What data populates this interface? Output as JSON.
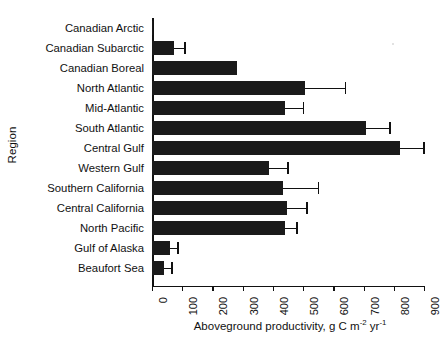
{
  "chart_data": {
    "type": "bar",
    "orientation": "horizontal",
    "title": "",
    "xlabel": "Aboveground productivity, g C m-2 yr-1",
    "xlabel_parts": {
      "pre": "Aboveground productivity, g C m",
      "sup1": "-2",
      "mid": " yr",
      "sup2": "-1"
    },
    "ylabel": "Region",
    "xlim": [
      0,
      900
    ],
    "xticks": [
      0,
      100,
      200,
      300,
      400,
      500,
      600,
      700,
      800,
      900
    ],
    "xtick_labels": [
      "0",
      "100",
      "200",
      "300",
      "400",
      "500",
      "600",
      "700",
      "800",
      "900"
    ],
    "grid": false,
    "legend": null,
    "bar_color": "#1a1a1a",
    "axis_color": "#111111",
    "categories": [
      "Canadian Arctic",
      "Canadian Subarctic",
      "Canadian Boreal",
      "North Atlantic",
      "Mid-Atlantic",
      "South Atlantic",
      "Central Gulf",
      "Western Gulf",
      "Southern California",
      "Central California",
      "North Pacific",
      "Gulf of Alaska",
      "Beaufort Sea"
    ],
    "values": [
      3,
      73,
      281,
      506,
      440,
      708,
      820,
      387,
      434,
      447,
      440,
      60,
      40
    ],
    "error_upper": [
      0,
      109,
      0,
      639,
      500,
      787,
      900,
      450,
      550,
      513,
      480,
      86,
      66
    ],
    "series": [
      {
        "name": "Aboveground productivity",
        "values": [
          3,
          73,
          281,
          506,
          440,
          708,
          820,
          387,
          434,
          447,
          440,
          60,
          40
        ]
      }
    ]
  }
}
